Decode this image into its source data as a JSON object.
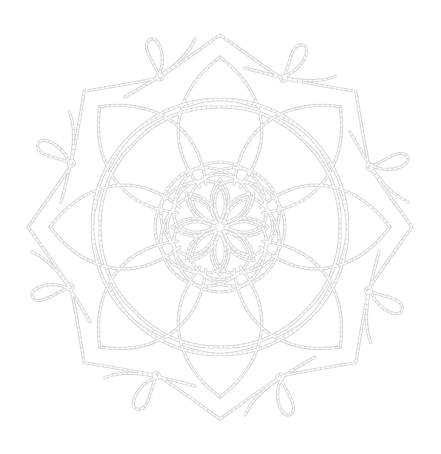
{
  "image": {
    "subject": "mandala line art",
    "symmetry": 8,
    "background": "#ffffff",
    "line_color": "#d6d6d6",
    "line_style": "dashed double stroke"
  },
  "mandala": {
    "center": [
      220,
      227
    ],
    "outer_radius": 190,
    "center_flower_petals": 8,
    "perimeter_loops": 8
  }
}
